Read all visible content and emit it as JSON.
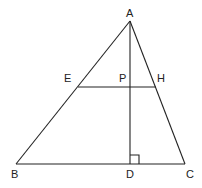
{
  "diagram": {
    "type": "geometry",
    "colors": {
      "stroke": "#222222",
      "background": "#ffffff"
    },
    "points": {
      "A": {
        "label": "A",
        "x": 130,
        "y": 21
      },
      "B": {
        "label": "B",
        "x": 16,
        "y": 164
      },
      "C": {
        "label": "C",
        "x": 185,
        "y": 164
      },
      "D": {
        "label": "D",
        "x": 130,
        "y": 164
      },
      "E": {
        "label": "E",
        "x": 78,
        "y": 87
      },
      "H": {
        "label": "H",
        "x": 156,
        "y": 87
      },
      "P": {
        "label": "P",
        "x": 130,
        "y": 87
      }
    },
    "segments": [
      "AB",
      "AC",
      "BC",
      "AD",
      "EH"
    ],
    "right_angle": "ADC"
  }
}
